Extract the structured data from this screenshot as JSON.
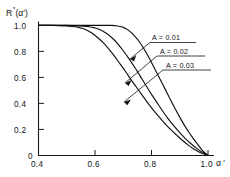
{
  "figure": {
    "ylabel": "R",
    "ylabel_sup": "*",
    "ylabel_arg": "(α')",
    "xlabel": "α '",
    "yticks": [
      "1.0",
      "0.8",
      "0.6",
      "0.4",
      "0.2",
      "0"
    ],
    "xticks": [
      "0.4",
      "0.6",
      "0.8",
      "1.0"
    ],
    "annotations": [
      {
        "label": "A = 0.01"
      },
      {
        "label": "A = 0.02"
      },
      {
        "label": "A = 0.03"
      }
    ]
  },
  "chart_data": {
    "type": "line",
    "title": "",
    "xlabel": "α '",
    "ylabel": "R*(α')",
    "xlim": [
      0.4,
      1.06
    ],
    "ylim": [
      0.0,
      1.06
    ],
    "xticks": [
      0.4,
      0.6,
      0.8,
      1.0
    ],
    "yticks": [
      0.0,
      0.2,
      0.4,
      0.6,
      0.8,
      1.0
    ],
    "xtick_labels": [
      "0.4",
      "0.6",
      "0.8",
      "1.0"
    ],
    "ytick_labels": [
      "0",
      "0.2",
      "0.4",
      "0.6",
      "0.8",
      "1.0"
    ],
    "grid": false,
    "legend": "inline-annotations",
    "series": [
      {
        "name": "A = 0.01",
        "x": [
          0.4,
          0.45,
          0.5,
          0.55,
          0.6,
          0.63,
          0.66,
          0.68,
          0.7,
          0.72,
          0.74,
          0.76,
          0.78,
          0.8,
          0.82,
          0.84,
          0.86,
          0.88,
          0.9,
          0.92,
          0.94,
          0.96,
          0.98,
          1.0
        ],
        "y": [
          1.0,
          1.0,
          1.0,
          1.0,
          1.0,
          1.0,
          1.0,
          0.995,
          0.985,
          0.96,
          0.92,
          0.865,
          0.795,
          0.715,
          0.63,
          0.545,
          0.46,
          0.375,
          0.295,
          0.22,
          0.155,
          0.095,
          0.04,
          0.0
        ]
      },
      {
        "name": "A = 0.02",
        "x": [
          0.4,
          0.45,
          0.5,
          0.55,
          0.58,
          0.6,
          0.62,
          0.64,
          0.66,
          0.68,
          0.7,
          0.72,
          0.74,
          0.76,
          0.78,
          0.8,
          0.82,
          0.84,
          0.86,
          0.88,
          0.9,
          0.92,
          0.94,
          0.96,
          0.98,
          1.0
        ],
        "y": [
          1.0,
          1.0,
          1.0,
          0.995,
          0.99,
          0.98,
          0.965,
          0.94,
          0.905,
          0.86,
          0.805,
          0.745,
          0.68,
          0.61,
          0.54,
          0.47,
          0.405,
          0.34,
          0.28,
          0.225,
          0.175,
          0.13,
          0.09,
          0.055,
          0.025,
          0.0
        ]
      },
      {
        "name": "A = 0.03",
        "x": [
          0.4,
          0.45,
          0.5,
          0.53,
          0.55,
          0.57,
          0.59,
          0.61,
          0.63,
          0.65,
          0.67,
          0.69,
          0.71,
          0.73,
          0.75,
          0.77,
          0.79,
          0.81,
          0.83,
          0.85,
          0.87,
          0.89,
          0.91,
          0.93,
          0.95,
          0.97,
          1.0
        ],
        "y": [
          1.0,
          1.0,
          0.995,
          0.99,
          0.98,
          0.965,
          0.94,
          0.905,
          0.865,
          0.815,
          0.76,
          0.7,
          0.64,
          0.575,
          0.515,
          0.455,
          0.395,
          0.34,
          0.29,
          0.24,
          0.195,
          0.155,
          0.115,
          0.08,
          0.05,
          0.025,
          0.0
        ]
      }
    ]
  }
}
